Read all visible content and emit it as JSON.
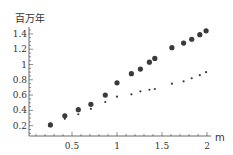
{
  "chart_data": {
    "type": "scatter",
    "title": "",
    "ylabel": "百万年",
    "xlabel": "m",
    "xlim": [
      0,
      2.05
    ],
    "ylim": [
      0.07,
      1.5
    ],
    "x_ticks": [
      0.5,
      1,
      1.5,
      2
    ],
    "x_tick_labels": [
      "0.5",
      "1",
      "1.5",
      "2"
    ],
    "y_ticks": [
      0.2,
      0.4,
      0.6,
      0.8,
      1,
      1.2,
      1.4
    ],
    "y_tick_labels": [
      "0.2",
      "0.4",
      "0.6",
      "0.8",
      "1",
      "1.2",
      "1.4"
    ],
    "grid": false,
    "legend": null,
    "series": [
      {
        "name": "large-points",
        "marker": "large-dot",
        "color": "#3a3a3a",
        "x": [
          0.26,
          0.42,
          0.57,
          0.71,
          0.87,
          1.0,
          1.16,
          1.26,
          1.36,
          1.42,
          1.61,
          1.74,
          1.83,
          1.92,
          1.99
        ],
        "y": [
          0.21,
          0.33,
          0.41,
          0.48,
          0.6,
          0.76,
          0.88,
          0.94,
          1.03,
          1.08,
          1.22,
          1.28,
          1.33,
          1.39,
          1.44
        ]
      },
      {
        "name": "small-points",
        "marker": "small-dot",
        "color": "#3a3a3a",
        "x": [
          0.42,
          0.57,
          0.71,
          0.87,
          1.0,
          1.16,
          1.26,
          1.36,
          1.42,
          1.61,
          1.74,
          1.83,
          1.92,
          1.99
        ],
        "y": [
          0.29,
          0.35,
          0.42,
          0.51,
          0.58,
          0.61,
          0.65,
          0.67,
          0.68,
          0.75,
          0.78,
          0.82,
          0.86,
          0.9
        ]
      }
    ]
  }
}
